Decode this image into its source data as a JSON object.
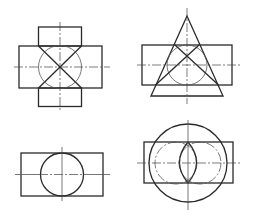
{
  "diagram": {
    "background": "#ffffff",
    "line_color": "#2a2a2a",
    "figures": [
      {
        "id": "cross-with-circle",
        "description": "Cross-shaped projection with inscribed circle and diagonal X",
        "center": [
          60,
          67
        ]
      },
      {
        "id": "triangle-over-rect",
        "description": "Triangle (cone projection) overlapping a rectangle with inscribed circle and crossing lines",
        "center": [
          187,
          65
        ]
      },
      {
        "id": "rect-with-circle",
        "description": "Rectangle with inscribed circle and centerlines",
        "center": [
          62,
          174
        ]
      },
      {
        "id": "rect-with-large-circle-and-lens",
        "description": "Rectangle with large circumscribing circle, two dash-dot circles and a central lens",
        "center": [
          188,
          163
        ]
      }
    ]
  }
}
